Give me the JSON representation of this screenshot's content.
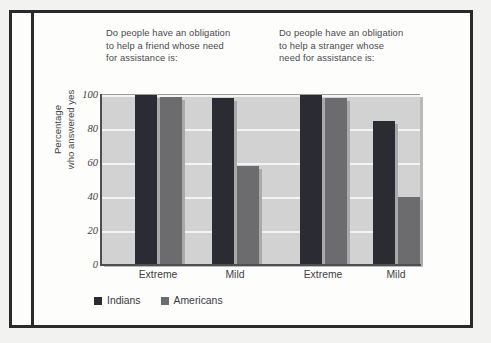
{
  "figure": {
    "group_headings": [
      "Do people have an obligation to help a friend whose need for assistance is:",
      "Do people have an obligation to help a stranger whose need for assistance is:"
    ]
  },
  "legend": {
    "items": [
      {
        "label": "Indians",
        "color": "#2b2b33",
        "swatch": "legend-swatch-indians"
      },
      {
        "label": "Americans",
        "color": "#6c6c6e",
        "swatch": "legend-swatch-americans"
      }
    ]
  },
  "axis": {
    "y_title_line1": "Percentage",
    "y_title_line2": "who answered yes",
    "y_ticks": [
      "100",
      "80",
      "60",
      "40",
      "20",
      "0"
    ],
    "x_labels": [
      "Extreme",
      "Mild",
      "Extreme",
      "Mild"
    ]
  },
  "chart_data": {
    "type": "bar",
    "title": "",
    "subtitle": "",
    "xlabel": "",
    "ylabel": "Percentage who answered yes",
    "ylim": [
      0,
      100
    ],
    "yticks": [
      0,
      20,
      40,
      60,
      80,
      100
    ],
    "grid": true,
    "legend_position": "bottom-left",
    "group_titles": [
      "Do people have an obligation to help a friend whose need for assistance is:",
      "Do people have an obligation to help a stranger whose need for assistance is:"
    ],
    "categories": [
      "Extreme (friend)",
      "Mild (friend)",
      "Extreme (stranger)",
      "Mild (stranger)"
    ],
    "category_labels": [
      "Extreme",
      "Mild",
      "Extreme",
      "Mild"
    ],
    "series": [
      {
        "name": "Indians",
        "color": "#2b2b33",
        "values": [
          100,
          98,
          100,
          85
        ]
      },
      {
        "name": "Americans",
        "color": "#6c6c6e",
        "values": [
          99,
          58,
          98,
          40
        ]
      }
    ]
  }
}
